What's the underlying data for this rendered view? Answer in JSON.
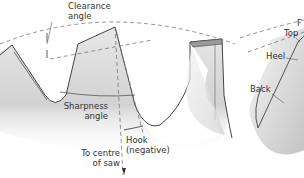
{
  "diagram": {
    "left_figure": {
      "labels": {
        "clearance_angle": [
          "Clearance",
          "angle"
        ],
        "sharpness_angle": [
          "Sharpness",
          "angle"
        ],
        "hook": [
          "Hook",
          "(negative)"
        ],
        "to_centre": [
          "To centre",
          "of saw"
        ]
      }
    },
    "right_figure": {
      "labels": {
        "face": "F",
        "top": "Top",
        "heel": "Heel",
        "back": "Back"
      }
    },
    "colors": {
      "line": "#444444",
      "dashed": "#777777",
      "fill_light": "#f2f2f2",
      "fill_dark": "#c8c8c8",
      "text": "#333333"
    }
  }
}
